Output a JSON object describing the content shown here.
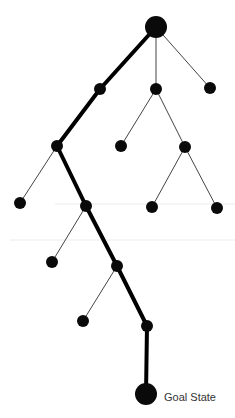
{
  "diagram": {
    "colors": {
      "node": "#0a0a0a",
      "edge": "#444444",
      "path_edge": "#000000",
      "guide_line": "#ececec",
      "label": "#333333"
    },
    "nodes": [
      {
        "id": "root",
        "x": 156,
        "y": 27,
        "r": 11
      },
      {
        "id": "n1",
        "x": 100,
        "y": 89,
        "r": 6
      },
      {
        "id": "n2",
        "x": 156,
        "y": 89,
        "r": 6
      },
      {
        "id": "n3",
        "x": 210,
        "y": 88,
        "r": 6
      },
      {
        "id": "n4",
        "x": 57,
        "y": 146,
        "r": 6
      },
      {
        "id": "n5",
        "x": 121,
        "y": 146,
        "r": 6
      },
      {
        "id": "n6",
        "x": 185,
        "y": 147,
        "r": 6
      },
      {
        "id": "n7",
        "x": 20,
        "y": 203,
        "r": 6
      },
      {
        "id": "n8",
        "x": 86,
        "y": 206,
        "r": 6
      },
      {
        "id": "n9",
        "x": 152,
        "y": 207,
        "r": 6
      },
      {
        "id": "n10",
        "x": 217,
        "y": 208,
        "r": 6
      },
      {
        "id": "n11",
        "x": 52,
        "y": 262,
        "r": 6
      },
      {
        "id": "n12",
        "x": 117,
        "y": 266,
        "r": 6
      },
      {
        "id": "n13",
        "x": 83,
        "y": 321,
        "r": 6
      },
      {
        "id": "n14",
        "x": 147,
        "y": 326,
        "r": 6
      },
      {
        "id": "goal",
        "x": 146,
        "y": 394,
        "r": 11
      }
    ],
    "edges": [
      {
        "from": "root",
        "to": "n1",
        "path": true
      },
      {
        "from": "root",
        "to": "n2",
        "path": false
      },
      {
        "from": "root",
        "to": "n3",
        "path": false
      },
      {
        "from": "n1",
        "to": "n4",
        "path": true
      },
      {
        "from": "n2",
        "to": "n5",
        "path": false
      },
      {
        "from": "n2",
        "to": "n6",
        "path": false
      },
      {
        "from": "n4",
        "to": "n7",
        "path": false
      },
      {
        "from": "n4",
        "to": "n8",
        "path": true
      },
      {
        "from": "n6",
        "to": "n9",
        "path": false
      },
      {
        "from": "n6",
        "to": "n10",
        "path": false
      },
      {
        "from": "n8",
        "to": "n11",
        "path": false
      },
      {
        "from": "n8",
        "to": "n12",
        "path": true
      },
      {
        "from": "n12",
        "to": "n13",
        "path": false
      },
      {
        "from": "n12",
        "to": "n14",
        "path": true
      },
      {
        "from": "n14",
        "to": "goal",
        "path": true
      }
    ],
    "guide_lines": [
      {
        "x1": 55,
        "x2": 235,
        "y": 204
      },
      {
        "x1": 10,
        "x2": 235,
        "y": 240
      }
    ],
    "goal_label": {
      "text": "Goal State",
      "x": 164,
      "y": 391
    }
  }
}
